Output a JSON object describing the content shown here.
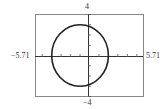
{
  "chart_data": {
    "type": "line",
    "title": "",
    "xlabel": "",
    "ylabel": "",
    "xlim": [
      -5.71,
      5.71
    ],
    "ylim": [
      -4,
      4
    ],
    "x_tick_labels": {
      "min": "−5.71",
      "max": "5.71"
    },
    "y_tick_labels": {
      "min": "−4",
      "max": "4"
    },
    "tick_spacing": 1,
    "grid": false,
    "legend": null,
    "series": [
      {
        "name": "circle",
        "shape": "circle",
        "center": [
          -1,
          0
        ],
        "radius": 3,
        "color": "#222222"
      }
    ]
  },
  "labels": {
    "top": "4",
    "bottom": "−4",
    "left": "−5.71",
    "right": "5.71"
  },
  "colors": {
    "frame": "#888888",
    "axis": "#333333",
    "curve": "#222222"
  }
}
